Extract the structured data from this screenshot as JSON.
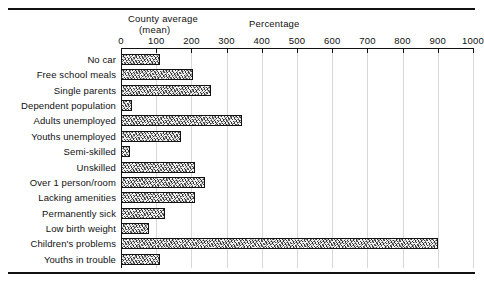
{
  "header": {
    "county_average_line1": "County average",
    "county_average_line2": "(mean)",
    "percentage_label": "Percentage"
  },
  "chart_data": {
    "type": "bar",
    "orientation": "horizontal",
    "title": "",
    "xlabel": "Percentage",
    "ylabel": "",
    "xlim": [
      0,
      1000
    ],
    "ticks": [
      0,
      100,
      200,
      300,
      400,
      500,
      600,
      700,
      800,
      900,
      1000
    ],
    "tick_labels": [
      "0",
      "100",
      "200",
      "300",
      "400",
      "500",
      "600",
      "700",
      "800",
      "900",
      "1000"
    ],
    "grid": true,
    "legend": "none",
    "annotations": [
      "County average (mean)",
      "Percentage"
    ],
    "categories": [
      "No car",
      "Free school meals",
      "Single parents",
      "Dependent population",
      "Adults unemployed",
      "Youths unemployed",
      "Semi-skilled",
      "Unskilled",
      "Over 1 person/room",
      "Lacking amenities",
      "Permanently sick",
      "Low birth weight",
      "Children's problems",
      "Youths in trouble"
    ],
    "values": [
      110,
      205,
      255,
      30,
      345,
      170,
      25,
      210,
      240,
      210,
      125,
      80,
      900,
      110
    ],
    "baseline": 100,
    "baseline_note": "County average (mean) = 100"
  },
  "style": {
    "bar_fill": "#f2f2f2",
    "bar_edge": "#111111",
    "grid_color": "#d8d8d8",
    "text_color": "#111111",
    "background": "#ffffff"
  }
}
